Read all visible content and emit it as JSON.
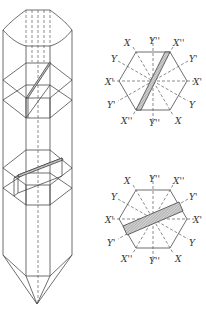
{
  "figure": {
    "colors": {
      "line": "#4a4a4a",
      "hatch_fill": "#bdbdbd",
      "background": "#ffffff"
    }
  },
  "top_section": {
    "labels": {
      "top_left": "X",
      "top_center": "Y''",
      "top_right": "X''",
      "upper_left": "Y",
      "upper_right": "Y'",
      "mid_left": "X'",
      "mid_right": "X'",
      "lower_left": "Y'",
      "lower_right": "Y",
      "bottom_left": "X''",
      "bottom_center": "Y''",
      "bottom_right": "X"
    },
    "plate_orientation": "steep diagonal"
  },
  "bottom_section": {
    "labels": {
      "top_left": "X",
      "top_center": "Y''",
      "top_right": "X''",
      "upper_left": "Y",
      "upper_right": "Y'",
      "mid_left": "X'",
      "mid_right": "X'",
      "lower_left": "Y'",
      "lower_right": "Y",
      "bottom_left": "X''",
      "bottom_center": "Y''",
      "bottom_right": "X"
    },
    "plate_orientation": "shallow diagonal"
  }
}
